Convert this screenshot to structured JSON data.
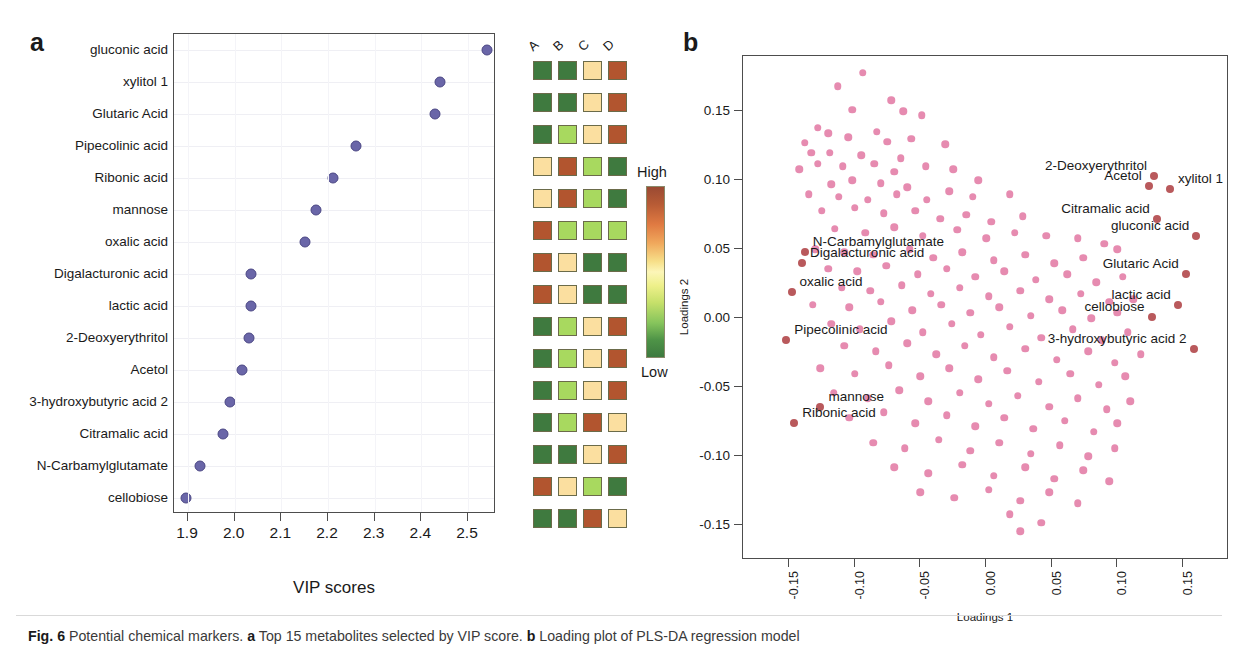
{
  "figure": {
    "label": "Fig. 6",
    "caption_parts": {
      "intro": "Potential chemical markers.",
      "a_tag": "a",
      "a_text": "Top 15 metabolites selected by VIP score.",
      "b_tag": "b",
      "b_text": "Loading plot of PLS-DA regression model"
    }
  },
  "panel_a": {
    "letter": "a",
    "xlabel": "VIP scores",
    "xticks": [
      "1.9",
      "2.0",
      "2.1",
      "2.2",
      "2.3",
      "2.4",
      "2.5"
    ],
    "heatmap_headers": [
      "A",
      "B",
      "C",
      "D"
    ],
    "legend": {
      "high": "High",
      "low": "Low"
    }
  },
  "panel_b": {
    "letter": "b",
    "xlabel": "Loadings 1",
    "ylabel": "Loadings 2",
    "xticks": [
      "-0.15",
      "-0.10",
      "-0.05",
      "0.00",
      "0.05",
      "0.10",
      "0.15"
    ],
    "yticks": [
      "0.15",
      "0.10",
      "0.05",
      "0.00",
      "-0.05",
      "-0.10",
      "-0.15"
    ]
  },
  "chart_data": [
    {
      "type": "scatter",
      "id": "vip-score-plot",
      "title": "Top 15 metabolites selected by VIP score",
      "xlabel": "VIP scores",
      "ylabel": "",
      "xlim": [
        1.87,
        2.56
      ],
      "ylim": [
        0,
        16
      ],
      "grid": true,
      "categories": [
        "gluconic acid",
        "xylitol 1",
        "Glutaric Acid",
        "Pipecolinic acid",
        "Ribonic acid",
        "mannose",
        "oxalic acid",
        "Digalacturonic acid",
        "lactic acid",
        "2-Deoxyerythritol",
        "Acetol",
        "3-hydroxybutyric acid 2",
        "Citramalic acid",
        "N-Carbamylglutamate",
        "cellobiose"
      ],
      "values": [
        2.54,
        2.44,
        2.43,
        2.26,
        2.21,
        2.175,
        2.15,
        2.035,
        2.035,
        2.03,
        2.015,
        1.99,
        1.975,
        1.925,
        1.895
      ],
      "marker_color": "#6a66a8",
      "heatmap": {
        "columns": [
          "A",
          "B",
          "C",
          "D"
        ],
        "scale": {
          "high_color": "#9a4a33",
          "low_color": "#3d7a3f",
          "high_label": "High",
          "low_label": "Low"
        },
        "rows": [
          {
            "metabolite": "gluconic acid",
            "colors": [
              "#3f7a3f",
              "#3f7a3f",
              "#fbdfa0",
              "#b2552f"
            ]
          },
          {
            "metabolite": "xylitol 1",
            "colors": [
              "#3f7a3f",
              "#3f7a3f",
              "#fbdfa0",
              "#b2552f"
            ]
          },
          {
            "metabolite": "Glutaric Acid",
            "colors": [
              "#3f7a3f",
              "#a8d95f",
              "#fbdfa0",
              "#b2552f"
            ]
          },
          {
            "metabolite": "Pipecolinic acid",
            "colors": [
              "#fbdfa0",
              "#b2552f",
              "#a8d95f",
              "#3f7a3f"
            ]
          },
          {
            "metabolite": "Ribonic acid",
            "colors": [
              "#fbdfa0",
              "#b2552f",
              "#a8d95f",
              "#3f7a3f"
            ]
          },
          {
            "metabolite": "mannose",
            "colors": [
              "#b2552f",
              "#a8d95f",
              "#a8d95f",
              "#a8d95f"
            ]
          },
          {
            "metabolite": "oxalic acid",
            "colors": [
              "#b2552f",
              "#fbdfa0",
              "#3f7a3f",
              "#3f7a3f"
            ]
          },
          {
            "metabolite": "Digalacturonic acid",
            "colors": [
              "#b2552f",
              "#fbdfa0",
              "#3f7a3f",
              "#3f7a3f"
            ]
          },
          {
            "metabolite": "lactic acid",
            "colors": [
              "#3f7a3f",
              "#a8d95f",
              "#fbdfa0",
              "#b2552f"
            ]
          },
          {
            "metabolite": "2-Deoxyerythritol",
            "colors": [
              "#3f7a3f",
              "#a8d95f",
              "#fbdfa0",
              "#b2552f"
            ]
          },
          {
            "metabolite": "Acetol",
            "colors": [
              "#3f7a3f",
              "#a8d95f",
              "#fbdfa0",
              "#b2552f"
            ]
          },
          {
            "metabolite": "3-hydroxybutyric acid 2",
            "colors": [
              "#3f7a3f",
              "#a8d95f",
              "#b2552f",
              "#fbdfa0"
            ]
          },
          {
            "metabolite": "Citramalic acid",
            "colors": [
              "#3f7a3f",
              "#3f7a3f",
              "#fbdfa0",
              "#b2552f"
            ]
          },
          {
            "metabolite": "N-Carbamylglutamate",
            "colors": [
              "#b2552f",
              "#fbdfa0",
              "#a8d95f",
              "#3f7a3f"
            ]
          },
          {
            "metabolite": "cellobiose",
            "colors": [
              "#3f7a3f",
              "#3f7a3f",
              "#b2552f",
              "#fbdfa0"
            ]
          }
        ]
      }
    },
    {
      "type": "scatter",
      "id": "pls-da-loading-plot",
      "title": "Loading plot of PLS-DA regression model",
      "xlabel": "Loadings 1",
      "ylabel": "Loadings 2",
      "xlim": [
        -0.185,
        0.185
      ],
      "ylim": [
        -0.175,
        0.19
      ],
      "grid": false,
      "marker_color": "#e68bb0",
      "highlight_color": "#b9595c",
      "labeled_points": [
        {
          "label": "2-Deoxyerythritol",
          "x": 0.128,
          "y": 0.103,
          "anchor": "right"
        },
        {
          "label": "Acetol",
          "x": 0.124,
          "y": 0.096,
          "anchor": "right"
        },
        {
          "label": "xylitol 1",
          "x": 0.14,
          "y": 0.094,
          "anchor": "left"
        },
        {
          "label": "Citramalic acid",
          "x": 0.13,
          "y": 0.072,
          "anchor": "right"
        },
        {
          "label": "gluconic acid",
          "x": 0.16,
          "y": 0.06,
          "anchor": "right"
        },
        {
          "label": "Glutaric Acid",
          "x": 0.152,
          "y": 0.032,
          "anchor": "right"
        },
        {
          "label": "lactic acid",
          "x": 0.146,
          "y": 0.01,
          "anchor": "right"
        },
        {
          "label": "cellobiose",
          "x": 0.126,
          "y": 0.001,
          "anchor": "right"
        },
        {
          "label": "3-hydroxybutyric acid 2",
          "x": 0.158,
          "y": -0.022,
          "anchor": "right"
        },
        {
          "label": "N-Carbamylglutamate",
          "x": -0.138,
          "y": 0.048,
          "anchor": "left"
        },
        {
          "label": "Digalacturonic acid",
          "x": -0.14,
          "y": 0.04,
          "anchor": "left"
        },
        {
          "label": "oxalic acid",
          "x": -0.148,
          "y": 0.019,
          "anchor": "left"
        },
        {
          "label": "Pipecolinic acid",
          "x": -0.152,
          "y": -0.016,
          "anchor": "left"
        },
        {
          "label": "mannose",
          "x": -0.126,
          "y": -0.064,
          "anchor": "left"
        },
        {
          "label": "Ribonic acid",
          "x": -0.146,
          "y": -0.076,
          "anchor": "left"
        }
      ],
      "points": [
        [
          -0.094,
          0.178
        ],
        [
          -0.113,
          0.168
        ],
        [
          -0.072,
          0.158
        ],
        [
          -0.102,
          0.151
        ],
        [
          -0.063,
          0.15
        ],
        [
          -0.049,
          0.147
        ],
        [
          -0.128,
          0.138
        ],
        [
          -0.12,
          0.134
        ],
        [
          -0.083,
          0.135
        ],
        [
          -0.105,
          0.131
        ],
        [
          -0.138,
          0.127
        ],
        [
          -0.075,
          0.128
        ],
        [
          -0.057,
          0.13
        ],
        [
          -0.031,
          0.126
        ],
        [
          -0.133,
          0.12
        ],
        [
          -0.119,
          0.12
        ],
        [
          -0.095,
          0.118
        ],
        [
          -0.065,
          0.116
        ],
        [
          -0.142,
          0.108
        ],
        [
          -0.128,
          0.112
        ],
        [
          -0.109,
          0.11
        ],
        [
          -0.085,
          0.112
        ],
        [
          -0.07,
          0.106
        ],
        [
          -0.046,
          0.11
        ],
        [
          -0.025,
          0.108
        ],
        [
          -0.102,
          0.1
        ],
        [
          -0.118,
          0.097
        ],
        [
          -0.08,
          0.098
        ],
        [
          -0.06,
          0.095
        ],
        [
          -0.006,
          0.1
        ],
        [
          -0.135,
          0.09
        ],
        [
          -0.112,
          0.088
        ],
        [
          -0.09,
          0.086
        ],
        [
          -0.068,
          0.09
        ],
        [
          -0.045,
          0.086
        ],
        [
          -0.028,
          0.092
        ],
        [
          -0.01,
          0.088
        ],
        [
          0.018,
          0.09
        ],
        [
          -0.125,
          0.078
        ],
        [
          -0.1,
          0.08
        ],
        [
          -0.078,
          0.076
        ],
        [
          -0.054,
          0.078
        ],
        [
          -0.035,
          0.072
        ],
        [
          -0.015,
          0.075
        ],
        [
          0.004,
          0.07
        ],
        [
          0.028,
          0.074
        ],
        [
          -0.115,
          0.065
        ],
        [
          -0.092,
          0.062
        ],
        [
          -0.07,
          0.066
        ],
        [
          -0.048,
          0.06
        ],
        [
          -0.022,
          0.064
        ],
        [
          0.0,
          0.058
        ],
        [
          0.022,
          0.062
        ],
        [
          0.046,
          0.06
        ],
        [
          0.07,
          0.058
        ],
        [
          0.09,
          0.054
        ],
        [
          0.1,
          0.05
        ],
        [
          -0.13,
          0.05
        ],
        [
          -0.108,
          0.048
        ],
        [
          -0.086,
          0.046
        ],
        [
          -0.058,
          0.05
        ],
        [
          -0.04,
          0.044
        ],
        [
          -0.018,
          0.048
        ],
        [
          0.006,
          0.042
        ],
        [
          0.03,
          0.046
        ],
        [
          0.052,
          0.04
        ],
        [
          0.074,
          0.044
        ],
        [
          -0.12,
          0.036
        ],
        [
          -0.098,
          0.034
        ],
        [
          -0.076,
          0.038
        ],
        [
          -0.052,
          0.032
        ],
        [
          -0.03,
          0.036
        ],
        [
          -0.008,
          0.03
        ],
        [
          0.014,
          0.034
        ],
        [
          0.038,
          0.028
        ],
        [
          0.062,
          0.032
        ],
        [
          0.084,
          0.026
        ],
        [
          0.104,
          0.03
        ],
        [
          -0.11,
          0.022
        ],
        [
          -0.088,
          0.02
        ],
        [
          -0.064,
          0.024
        ],
        [
          -0.042,
          0.018
        ],
        [
          -0.02,
          0.022
        ],
        [
          0.002,
          0.016
        ],
        [
          0.026,
          0.02
        ],
        [
          0.048,
          0.014
        ],
        [
          0.072,
          0.018
        ],
        [
          0.094,
          0.012
        ],
        [
          0.112,
          0.014
        ],
        [
          -0.132,
          0.01
        ],
        [
          -0.104,
          0.008
        ],
        [
          -0.08,
          0.012
        ],
        [
          -0.056,
          0.006
        ],
        [
          -0.034,
          0.01
        ],
        [
          -0.012,
          0.004
        ],
        [
          0.01,
          0.008
        ],
        [
          0.034,
          0.002
        ],
        [
          0.058,
          0.006
        ],
        [
          0.08,
          0.0
        ],
        [
          0.1,
          0.004
        ],
        [
          -0.118,
          -0.004
        ],
        [
          -0.096,
          -0.008
        ],
        [
          -0.072,
          -0.002
        ],
        [
          -0.048,
          -0.01
        ],
        [
          -0.026,
          -0.004
        ],
        [
          -0.004,
          -0.012
        ],
        [
          0.018,
          -0.006
        ],
        [
          0.042,
          -0.014
        ],
        [
          0.066,
          -0.008
        ],
        [
          0.088,
          -0.016
        ],
        [
          0.108,
          -0.01
        ],
        [
          -0.108,
          -0.02
        ],
        [
          -0.084,
          -0.024
        ],
        [
          -0.06,
          -0.018
        ],
        [
          -0.038,
          -0.026
        ],
        [
          -0.016,
          -0.02
        ],
        [
          0.006,
          -0.028
        ],
        [
          0.03,
          -0.022
        ],
        [
          0.054,
          -0.03
        ],
        [
          0.078,
          -0.024
        ],
        [
          0.098,
          -0.032
        ],
        [
          0.118,
          -0.026
        ],
        [
          -0.126,
          -0.036
        ],
        [
          -0.1,
          -0.04
        ],
        [
          -0.074,
          -0.034
        ],
        [
          -0.05,
          -0.042
        ],
        [
          -0.028,
          -0.036
        ],
        [
          -0.006,
          -0.044
        ],
        [
          0.016,
          -0.038
        ],
        [
          0.04,
          -0.046
        ],
        [
          0.064,
          -0.04
        ],
        [
          0.086,
          -0.048
        ],
        [
          0.106,
          -0.042
        ],
        [
          -0.116,
          -0.054
        ],
        [
          -0.09,
          -0.058
        ],
        [
          -0.066,
          -0.052
        ],
        [
          -0.044,
          -0.06
        ],
        [
          -0.02,
          -0.054
        ],
        [
          0.002,
          -0.062
        ],
        [
          0.024,
          -0.056
        ],
        [
          0.048,
          -0.064
        ],
        [
          0.07,
          -0.058
        ],
        [
          0.092,
          -0.066
        ],
        [
          0.11,
          -0.06
        ],
        [
          -0.104,
          -0.072
        ],
        [
          -0.078,
          -0.068
        ],
        [
          -0.054,
          -0.076
        ],
        [
          -0.03,
          -0.07
        ],
        [
          -0.008,
          -0.078
        ],
        [
          0.014,
          -0.072
        ],
        [
          0.036,
          -0.08
        ],
        [
          0.06,
          -0.074
        ],
        [
          0.082,
          -0.082
        ],
        [
          0.1,
          -0.076
        ],
        [
          -0.086,
          -0.09
        ],
        [
          -0.062,
          -0.094
        ],
        [
          -0.036,
          -0.088
        ],
        [
          -0.012,
          -0.096
        ],
        [
          0.01,
          -0.09
        ],
        [
          0.034,
          -0.098
        ],
        [
          0.056,
          -0.092
        ],
        [
          0.078,
          -0.1
        ],
        [
          0.098,
          -0.094
        ],
        [
          -0.07,
          -0.108
        ],
        [
          -0.044,
          -0.112
        ],
        [
          -0.018,
          -0.106
        ],
        [
          0.006,
          -0.114
        ],
        [
          0.03,
          -0.108
        ],
        [
          0.052,
          -0.116
        ],
        [
          0.074,
          -0.11
        ],
        [
          0.094,
          -0.118
        ],
        [
          -0.05,
          -0.126
        ],
        [
          -0.024,
          -0.13
        ],
        [
          0.002,
          -0.124
        ],
        [
          0.026,
          -0.132
        ],
        [
          0.048,
          -0.126
        ],
        [
          0.07,
          -0.134
        ],
        [
          0.018,
          -0.142
        ],
        [
          0.042,
          -0.148
        ],
        [
          0.026,
          -0.154
        ]
      ]
    }
  ]
}
